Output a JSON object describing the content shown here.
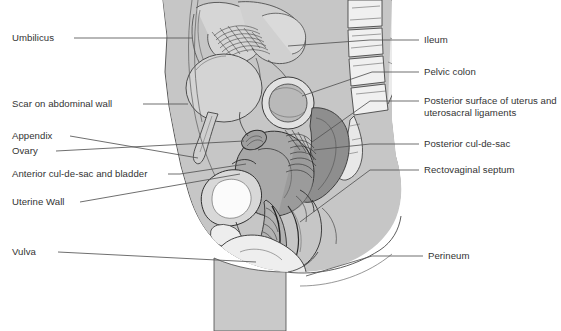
{
  "diagram": {
    "type": "medical-anatomical-illustration",
    "view": "midsagittal",
    "background_color": "#ffffff",
    "ink_color": "#333333",
    "body_fill": "#c9c9c9",
    "organ_fill_light": "#dcdcdc",
    "organ_fill_mid": "#b4b4b4",
    "organ_fill_dark": "#8a8a8a",
    "leader_line_color": "#555555"
  },
  "labels_left": [
    {
      "id": "umbilicus",
      "text": "Umbilicus",
      "x": 12,
      "y": 32,
      "line_x1": 74,
      "line_x2": 192,
      "line_y": 38
    },
    {
      "id": "scar-on-abdominal-wall",
      "text": "Scar on abdominal wall",
      "x": 12,
      "y": 98,
      "line_x1": 143,
      "line_x2": 188,
      "line_y": 104
    },
    {
      "id": "appendix",
      "text": "Appendix",
      "x": 12,
      "y": 130,
      "line_x1": 70,
      "line_x2": 240,
      "line_y": 136
    },
    {
      "id": "ovary",
      "text": "Ovary",
      "x": 12,
      "y": 145,
      "line_x1": 56,
      "line_x2": 248,
      "line_y": 151
    },
    {
      "id": "anterior-cul-de-sac-and-bladder",
      "text": "Anterior cul-de-sac and bladder",
      "x": 12,
      "y": 168,
      "line_x1": 168,
      "line_x2": 252,
      "line_y": 174
    },
    {
      "id": "uterine-wall",
      "text": "Uterine Wall",
      "x": 12,
      "y": 196,
      "line_x1": 80,
      "line_x2": 232,
      "line_y": 202
    },
    {
      "id": "vulva",
      "text": "Vulva",
      "x": 12,
      "y": 246,
      "line_x1": 58,
      "line_x2": 250,
      "line_y": 252
    }
  ],
  "labels_right": [
    {
      "id": "ileum",
      "text": "Ileum",
      "x": 424,
      "y": 34,
      "line_x1": 370,
      "line_x2": 419,
      "line_y": 40
    },
    {
      "id": "pelvic-colon",
      "text": "Pelvic colon",
      "x": 424,
      "y": 66,
      "line_x1": 370,
      "line_x2": 419,
      "line_y": 72
    },
    {
      "id": "posterior-surface-of-uterus",
      "text": "Posterior surface of uterus and uterosacral ligaments",
      "x": 424,
      "y": 95,
      "line_x1": 370,
      "line_x2": 419,
      "line_y": 101
    },
    {
      "id": "posterior-cul-de-sac",
      "text": "Posterior cul-de-sac",
      "x": 424,
      "y": 138,
      "line_x1": 370,
      "line_x2": 419,
      "line_y": 144
    },
    {
      "id": "rectovaginal-septum",
      "text": "Rectovaginal septum",
      "x": 424,
      "y": 164,
      "line_x1": 370,
      "line_x2": 419,
      "line_y": 170
    },
    {
      "id": "perineum",
      "text": "Perineum",
      "x": 428,
      "y": 250,
      "line_x1": 372,
      "line_x2": 423,
      "line_y": 256
    }
  ]
}
